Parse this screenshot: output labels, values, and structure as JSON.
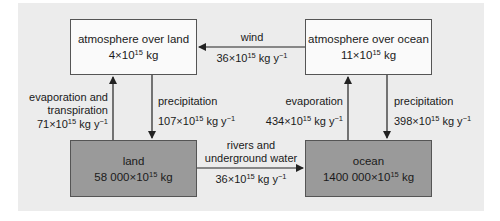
{
  "diagram": {
    "colors": {
      "panel_bg": "#ececec",
      "atmosphere_box": "#fafafa",
      "surface_box": "#9a9a9a",
      "line": "#222222"
    },
    "nodes": {
      "atm_land": {
        "name": "atmosphere over land",
        "mass_coef": "4",
        "mass_exp": "15",
        "mass_unit": "kg"
      },
      "atm_ocean": {
        "name": "atmosphere over ocean",
        "mass_coef": "11",
        "mass_exp": "15",
        "mass_unit": "kg"
      },
      "land": {
        "name": "land",
        "mass_coef": "58 000",
        "mass_exp": "15",
        "mass_unit": "kg"
      },
      "ocean": {
        "name": "ocean",
        "mass_coef": "1400 000",
        "mass_exp": "15",
        "mass_unit": "kg"
      }
    },
    "flows": {
      "wind": {
        "label": "wind",
        "coef": "36",
        "exp": "15",
        "unit": "kg y",
        "unit_exp": "−1",
        "from": "atmosphere over ocean",
        "to": "atmosphere over land"
      },
      "evap_transp": {
        "label_line1": "evaporation and",
        "label_line2": "transpiration",
        "coef": "71",
        "exp": "15",
        "unit": "kg y",
        "unit_exp": "−1",
        "from": "land",
        "to": "atmosphere over land"
      },
      "precip_land": {
        "label": "precipitation",
        "coef": "107",
        "exp": "15",
        "unit": "kg y",
        "unit_exp": "−1",
        "from": "atmosphere over land",
        "to": "land"
      },
      "evap_ocean": {
        "label": "evaporation",
        "coef": "434",
        "exp": "15",
        "unit": "kg y",
        "unit_exp": "−1",
        "from": "ocean",
        "to": "atmosphere over ocean"
      },
      "precip_ocean": {
        "label": "precipitation",
        "coef": "398",
        "exp": "15",
        "unit": "kg y",
        "unit_exp": "−1",
        "from": "atmosphere over ocean",
        "to": "ocean"
      },
      "rivers": {
        "label_line1": "rivers and",
        "label_line2": "underground water",
        "coef": "36",
        "exp": "15",
        "unit": "kg y",
        "unit_exp": "−1",
        "from": "land",
        "to": "ocean"
      }
    },
    "times": "×10"
  }
}
